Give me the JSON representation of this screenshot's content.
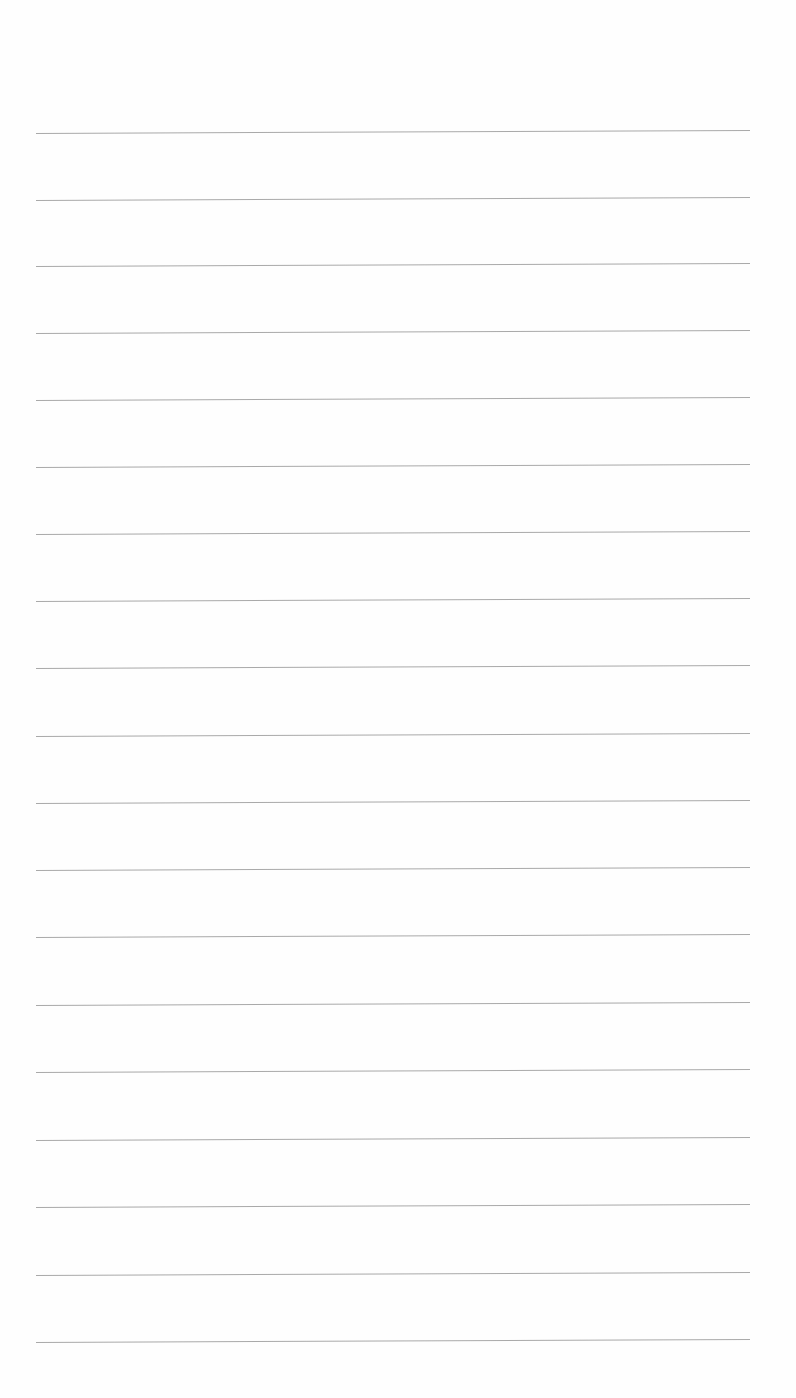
{
  "document": {
    "type": "blank lined notepaper",
    "content": "",
    "line_color": "#9a9a9a",
    "line_count": 19,
    "lines_y": [
      133,
      200,
      266,
      333,
      400,
      467,
      534,
      601,
      668,
      736,
      803,
      870,
      937,
      1005,
      1072,
      1140,
      1207,
      1275,
      1342
    ]
  }
}
